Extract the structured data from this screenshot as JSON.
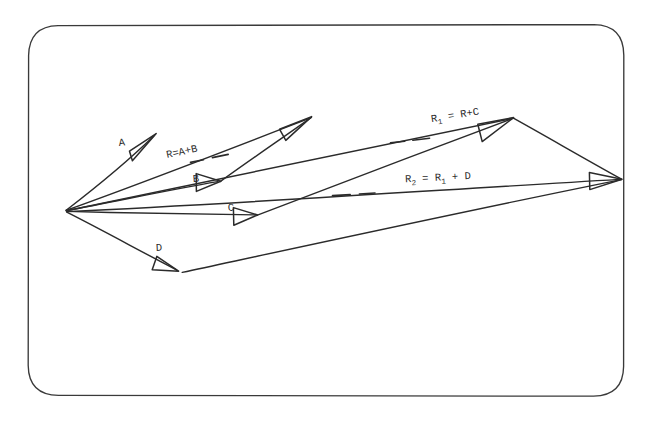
{
  "document": {
    "title": "Vector Addition Diagram",
    "style": "hand-drawn pen sketch",
    "background_color": "#ffffff",
    "ink_color": "#2b2b2b",
    "frame": {
      "shape": "rounded-rectangle",
      "x": 28,
      "y": 25,
      "width": 596,
      "height": 371,
      "corner_radius": 30,
      "stroke_width": 1.3
    }
  },
  "diagram": {
    "origin": {
      "x": 66,
      "y": 210
    },
    "vectors": [
      {
        "id": "A",
        "label": "A",
        "label_x": 120,
        "label_y": 143,
        "tip_x": 156,
        "tip_y": 134,
        "description": "vector A from origin pointing up-right"
      },
      {
        "id": "B",
        "label": "B",
        "label_x": 194,
        "label_y": 180,
        "tip_x": 220,
        "tip_y": 181,
        "description": "vector B from origin pointing right and slightly up"
      },
      {
        "id": "C",
        "label": "C",
        "label_x": 229,
        "label_y": 209,
        "tip_x": 257,
        "tip_y": 215,
        "description": "vector C from origin pointing right, nearly horizontal"
      },
      {
        "id": "D",
        "label": "D",
        "label_x": 157,
        "label_y": 249,
        "tip_x": 178,
        "tip_y": 271,
        "description": "vector D from origin pointing down-right"
      }
    ],
    "resultants": [
      {
        "id": "R",
        "label_parts": {
          "base": "R=A+B"
        },
        "label_text": "R=A+B",
        "label_x": 168,
        "label_y": 156,
        "label_rotation": -11,
        "tip_x": 311,
        "tip_y": 117,
        "description": "resultant R equals A plus B, long arrow to upper right",
        "leader_dashes": [
          {
            "x1": 209,
            "y1": 158,
            "x2": 222,
            "y2": 156
          },
          {
            "x1": 228,
            "y1": 155,
            "x2": 241,
            "y2": 152
          }
        ]
      },
      {
        "id": "R1",
        "label_text": "R₁ = R+C",
        "label_main": "R",
        "label_sub": "1",
        "label_rest": " = R+C",
        "label_x": 363,
        "label_y": 131,
        "label_rotation": -9,
        "tip_x": 513,
        "tip_y": 118,
        "description": "resultant R1 equals R plus C",
        "leader_dashes": [
          {
            "x1": 383,
            "y1": 144,
            "x2": 398,
            "y2": 143
          },
          {
            "x1": 408,
            "y1": 141,
            "x2": 425,
            "y2": 139
          }
        ]
      },
      {
        "id": "R2",
        "label_text": "R₂ = R₁ + D",
        "label_main": "R",
        "label_sub": "2",
        "label_rest": " = R",
        "label_sub2": "1",
        "label_rest2": " + D",
        "label_x": 336,
        "label_y": 184,
        "label_rotation": -2,
        "tip_x": 622,
        "tip_y": 179,
        "description": "resultant R2 equals R1 plus D, longest arrow to the right",
        "leader_dashes": [
          {
            "x1": 333,
            "y1": 198,
            "x2": 353,
            "y2": 196
          },
          {
            "x1": 362,
            "y1": 195,
            "x2": 376,
            "y2": 194
          }
        ]
      }
    ],
    "closures": [
      {
        "id": "C-to-R1-tip",
        "from": "C tip",
        "to": "R1 tip",
        "x1": 257,
        "y1": 215,
        "x2": 513,
        "y2": 118
      },
      {
        "id": "R1-tip-to-R2-tip",
        "from": "R1 tip",
        "to": "R2 tip",
        "x1": 513,
        "y1": 118,
        "x2": 622,
        "y2": 179
      },
      {
        "id": "D-tip-to-R2-tip",
        "from": "D tip",
        "to": "R2 tip",
        "x1": 182,
        "y1": 272,
        "x2": 622,
        "y2": 179
      },
      {
        "id": "B-tip-to-R-tip",
        "from": "B tip",
        "to": "R tip",
        "x1": 220,
        "y1": 181,
        "x2": 311,
        "y2": 117
      }
    ]
  }
}
